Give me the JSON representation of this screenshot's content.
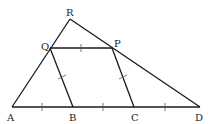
{
  "diagram": {
    "labels": {
      "R": "R",
      "Q": "Q",
      "P": "P",
      "A": "A",
      "B": "B",
      "C": "C",
      "D": "D"
    },
    "points": {
      "R": [
        70,
        19
      ],
      "Q": [
        50,
        48
      ],
      "P": [
        112,
        48
      ],
      "A": [
        12,
        107
      ],
      "B": [
        73,
        107
      ],
      "C": [
        134,
        107
      ],
      "D": [
        200,
        107
      ]
    },
    "segments": [
      [
        "A",
        "R"
      ],
      [
        "R",
        "D"
      ],
      [
        "A",
        "D"
      ],
      [
        "Q",
        "P"
      ],
      [
        "Q",
        "B"
      ],
      [
        "P",
        "C"
      ]
    ],
    "tick_marks": [
      "AB",
      "BC",
      "CD",
      "QP",
      "QB",
      "PC"
    ],
    "stroke_color": "#1a1a1a"
  }
}
